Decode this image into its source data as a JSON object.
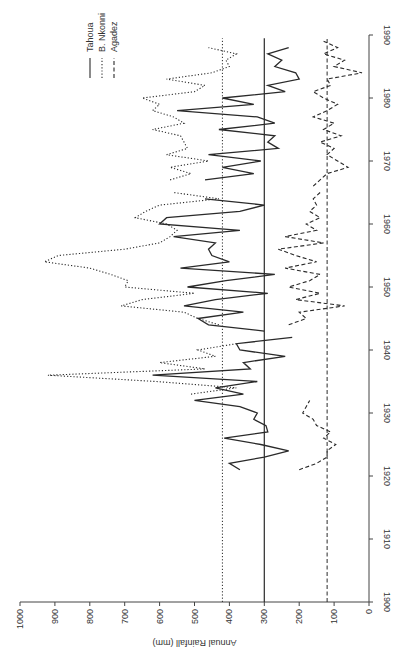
{
  "chart_data": {
    "type": "line",
    "title": "",
    "orientation": "rotated-90-ccw",
    "xlabel": "",
    "ylabel": "Annual Rainfall (mm)",
    "xlim": [
      1900,
      1990
    ],
    "ylim": [
      0,
      1000
    ],
    "x_ticks": [
      1900,
      1910,
      1920,
      1930,
      1940,
      1950,
      1960,
      1970,
      1980,
      1990
    ],
    "y_ticks": [
      0,
      100,
      200,
      300,
      400,
      500,
      600,
      700,
      800,
      900,
      1000
    ],
    "grid": false,
    "legend": {
      "position": "top-left (rotated)",
      "entries": [
        {
          "label": "Tahoua",
          "style": "solid"
        },
        {
          "label": "B. Nkonni",
          "style": "dotted"
        },
        {
          "label": "Agadez",
          "style": "dashed"
        }
      ]
    },
    "reference_lines": [
      {
        "series": "B. Nkonni",
        "value": 420,
        "style": "dotted"
      },
      {
        "series": "Tahoua",
        "value": 300,
        "style": "solid"
      },
      {
        "series": "Agadez",
        "value": 120,
        "style": "dashed"
      }
    ],
    "series": [
      {
        "name": "Tahoua",
        "style": "solid",
        "segments": [
          {
            "x": [
              1921,
              1922,
              1923,
              1924,
              1925,
              1926,
              1927,
              1928,
              1929,
              1930,
              1931,
              1932,
              1933,
              1934,
              1935,
              1936,
              1937,
              1938,
              1939,
              1940,
              1941,
              1942
            ],
            "y": [
              370,
              400,
              300,
              230,
              310,
              415,
              290,
              295,
              330,
              320,
              370,
              500,
              360,
              440,
              320,
              620,
              340,
              360,
              240,
              370,
              380,
              220
            ]
          },
          {
            "x": [
              1943,
              1944,
              1945,
              1946,
              1947,
              1948,
              1949,
              1950,
              1951,
              1952,
              1953,
              1954,
              1955,
              1956,
              1957,
              1958,
              1959,
              1960,
              1961,
              1962,
              1963,
              1964
            ],
            "y": [
              300,
              460,
              490,
              360,
              530,
              440,
              290,
              520,
              410,
              270,
              540,
              400,
              450,
              460,
              440,
              560,
              370,
              600,
              580,
              370,
              300,
              470
            ]
          },
          {
            "x": [
              1967,
              1968,
              1969,
              1970,
              1971,
              1972,
              1973,
              1974,
              1975,
              1976,
              1977,
              1978,
              1979,
              1980,
              1981,
              1982,
              1983,
              1984,
              1985,
              1986,
              1987,
              1988
            ],
            "y": [
              470,
              330,
              420,
              310,
              460,
              260,
              290,
              270,
              430,
              270,
              320,
              550,
              330,
              420,
              240,
              290,
              200,
              210,
              270,
              250,
              290,
              230
            ]
          }
        ]
      },
      {
        "name": "B. Nkonni",
        "style": "dotted",
        "segments": [
          {
            "x": [
              1933,
              1934,
              1935,
              1936,
              1937,
              1938,
              1939,
              1940,
              1941
            ],
            "y": [
              510,
              380,
              610,
              920,
              470,
              600,
              440,
              490,
              380
            ]
          },
          {
            "x": [
              1944,
              1945,
              1946,
              1947,
              1948,
              1949,
              1950,
              1951,
              1952,
              1953,
              1954,
              1955,
              1956,
              1957,
              1958,
              1959,
              1960,
              1961,
              1962,
              1963,
              1964,
              1965
            ],
            "y": [
              430,
              490,
              530,
              710,
              650,
              500,
              700,
              690,
              740,
              800,
              930,
              890,
              700,
              600,
              570,
              550,
              580,
              670,
              640,
              600,
              430,
              560
            ]
          },
          {
            "x": [
              1967,
              1968,
              1969,
              1970,
              1971,
              1972,
              1973,
              1974,
              1975,
              1976,
              1977,
              1978,
              1979,
              1980,
              1981,
              1982,
              1983,
              1984,
              1985,
              1986,
              1987,
              1988
            ],
            "y": [
              570,
              510,
              570,
              460,
              580,
              520,
              530,
              540,
              620,
              530,
              560,
              620,
              600,
              650,
              500,
              470,
              580,
              450,
              400,
              410,
              380,
              460
            ]
          }
        ]
      },
      {
        "name": "Agadez",
        "style": "dashed",
        "segments": [
          {
            "x": [
              1921,
              1922,
              1923,
              1924,
              1925,
              1926,
              1927,
              1928,
              1929,
              1930,
              1931,
              1932
            ],
            "y": [
              200,
              150,
              120,
              120,
              95,
              130,
              110,
              150,
              160,
              190,
              180,
              170
            ]
          },
          {
            "x": [
              1944,
              1945,
              1946,
              1947,
              1948,
              1949,
              1950,
              1951,
              1952,
              1953,
              1954,
              1955,
              1956,
              1957,
              1958,
              1959,
              1960,
              1961,
              1962,
              1963,
              1964,
              1965
            ],
            "y": [
              230,
              180,
              200,
              70,
              210,
              140,
              230,
              170,
              140,
              240,
              150,
              210,
              260,
              130,
              240,
              150,
              180,
              140,
              170,
              150,
              160,
              140
            ]
          },
          {
            "x": [
              1966,
              1967,
              1968,
              1969,
              1970,
              1971,
              1972,
              1973,
              1974,
              1975,
              1976,
              1977,
              1978,
              1979,
              1980,
              1981,
              1982,
              1983,
              1984,
              1985,
              1986,
              1987,
              1988,
              1989
            ],
            "y": [
              160,
              140,
              120,
              60,
              90,
              120,
              100,
              140,
              80,
              130,
              100,
              160,
              120,
              90,
              130,
              160,
              110,
              120,
              20,
              100,
              70,
              130,
              90,
              130
            ]
          }
        ]
      }
    ]
  },
  "legend": {
    "items": [
      {
        "label": "Tahoua"
      },
      {
        "label": "B. Nkonni"
      },
      {
        "label": "Agadez"
      }
    ]
  },
  "axes": {
    "rainfall_title": "Annual Rainfall (mm)",
    "rainfall_ticks": [
      "1000",
      "900",
      "800",
      "700",
      "600",
      "500",
      "400",
      "300",
      "200",
      "100",
      "0"
    ],
    "year_ticks": [
      "1900",
      "1910",
      "1920",
      "1930",
      "1940",
      "1950",
      "1960",
      "1970",
      "1980",
      "1990"
    ]
  },
  "colors": {
    "line": "#2a2a2a",
    "axis": "#444444",
    "background": "#ffffff"
  }
}
